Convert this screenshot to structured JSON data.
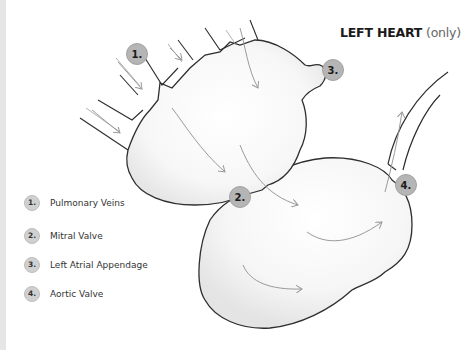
{
  "title": {
    "main": "LEFT HEART",
    "qualifier": "(only)"
  },
  "badges": [
    {
      "label": "1.",
      "x": 126,
      "y": 43
    },
    {
      "label": "2.",
      "x": 229,
      "y": 186
    },
    {
      "label": "3.",
      "x": 322,
      "y": 59
    },
    {
      "label": "4.",
      "x": 395,
      "y": 174
    }
  ],
  "legend": {
    "items": [
      {
        "num": "1.",
        "label": "Pulmonary Veins"
      },
      {
        "num": "2.",
        "label": "Mitral Valve"
      },
      {
        "num": "3.",
        "label": "Left Atrial Appendage"
      },
      {
        "num": "4.",
        "label": "Aortic Valve"
      }
    ]
  },
  "colors": {
    "outline": "#2e2e2e",
    "arrow": "#9a9a9a",
    "shade": "#e9e9e9",
    "badge": "#b5b5b5"
  }
}
